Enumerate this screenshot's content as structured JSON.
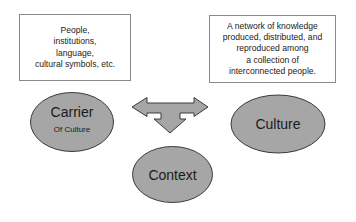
{
  "diagram": {
    "boxes": {
      "carrier_description": {
        "lines": [
          "People,",
          "institutions,",
          "language,",
          "cultural symbols, etc."
        ]
      },
      "culture_description": {
        "lines": [
          "A network of knowledge",
          "produced, distributed, and",
          "reproduced among",
          "a collection of",
          "interconnected people."
        ]
      }
    },
    "nodes": {
      "carrier": {
        "title": "Carrier",
        "subtitle": "Of Culture"
      },
      "culture": {
        "title": "Culture"
      },
      "context": {
        "title": "Context"
      }
    },
    "connector": {
      "icon": "three-way-arrow-icon",
      "directions": [
        "left",
        "right",
        "down"
      ]
    },
    "colors": {
      "node_fill": "#a6a6a6",
      "node_stroke": "#3a3a3a",
      "box_border": "#8a8a8a"
    }
  }
}
